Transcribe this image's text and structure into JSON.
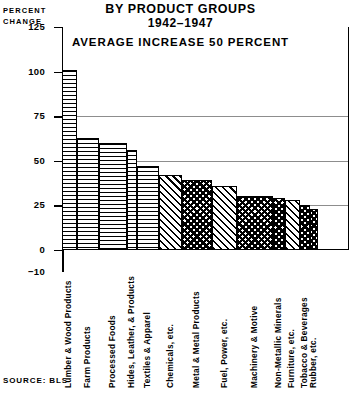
{
  "header": {
    "axis_caption_line1": "PERCENT",
    "axis_caption_line2": "CHANGE",
    "title_main": "BY PRODUCT GROUPS",
    "title_sub": "1942–1947",
    "average_note": "AVERAGE INCREASE 50 PERCENT"
  },
  "footer": {
    "source": "SOURCE: BLS"
  },
  "chart_data": {
    "type": "bar",
    "title": "BY PRODUCT GROUPS 1942–1947",
    "subtitle": "AVERAGE INCREASE 50 PERCENT",
    "xlabel": "",
    "ylabel": "PERCENT CHANGE",
    "ylim": [
      -10,
      125
    ],
    "yticks": [
      125,
      100,
      75,
      50,
      25,
      0,
      -10
    ],
    "ytick_labels": [
      "125",
      "100",
      "75",
      "50",
      "25",
      "0",
      "−10"
    ],
    "gridlines": [
      75,
      50,
      25
    ],
    "grid": true,
    "legend": "none",
    "average_line_value": 50,
    "source": "SOURCE: BLS",
    "categories": [
      "Lumber & Wood Products",
      "Farm Products",
      "Processed Foods",
      "Hides, Leather, & Products",
      "Textiles & Apparel",
      "Chemicals, etc.",
      "Metal & Metal Products",
      "Fuel, Power, etc.",
      "Machinery & Motive",
      "Non-Metallic Minerals",
      "Furniture, etc.",
      "Tobacco & Beverages",
      "Rubber, etc."
    ],
    "values": [
      101,
      63,
      60,
      56,
      47,
      42,
      39,
      36,
      30,
      29,
      28,
      25,
      23
    ],
    "patterns": [
      "horizontal-lines",
      "horizontal-lines",
      "horizontal-lines",
      "horizontal-lines",
      "horizontal-lines",
      "diagonal-hatch",
      "checkered",
      "diagonal-hatch",
      "checkered",
      "checkered",
      "diagonal-hatch",
      "checkered",
      "checkered"
    ],
    "bar_widths": [
      17,
      25,
      32,
      11,
      25,
      27,
      34,
      28,
      41,
      13,
      18,
      11,
      9
    ]
  }
}
